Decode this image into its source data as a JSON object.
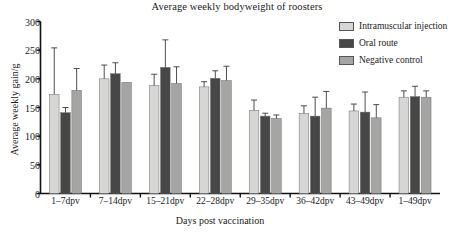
{
  "chart_data": {
    "type": "bar",
    "title": "Average weekly bodyweight of roosters",
    "xlabel": "Days post vaccination",
    "ylabel": "Average weekly gain/g",
    "ylim": [
      0,
      300
    ],
    "yticks": [
      0,
      50,
      100,
      150,
      200,
      250,
      300
    ],
    "grid": false,
    "legend_position": "top-right",
    "error_bars": "standard deviation",
    "categories": [
      "1–7dpv",
      "7–14dpv",
      "15–21dpv",
      "22–28dpv",
      "29–35dpv",
      "36–42dpv",
      "43–49dpv",
      "1–49dpv"
    ],
    "series": [
      {
        "name": "Intramuscular injection",
        "color": "#d6d6d4",
        "values": [
          173,
          200,
          188,
          186,
          145,
          140,
          144,
          168
        ],
        "errors": [
          81,
          24,
          20,
          9,
          18,
          13,
          12,
          11
        ]
      },
      {
        "name": "Oral route",
        "color": "#474747",
        "values": [
          141,
          209,
          220,
          201,
          135,
          135,
          142,
          169
        ],
        "errors": [
          9,
          19,
          48,
          13,
          5,
          33,
          35,
          18
        ]
      },
      {
        "name": "Negative control",
        "color": "#a5a5a3",
        "values": [
          180,
          194,
          192,
          197,
          131,
          149,
          132,
          168
        ],
        "errors": [
          38,
          0,
          29,
          25,
          6,
          29,
          23,
          11
        ]
      }
    ]
  },
  "legend": {
    "items": [
      {
        "label": "Intramuscular injection",
        "color": "#d6d6d4"
      },
      {
        "label": "Oral route",
        "color": "#474747"
      },
      {
        "label": "Negative control",
        "color": "#a5a5a3"
      }
    ]
  }
}
